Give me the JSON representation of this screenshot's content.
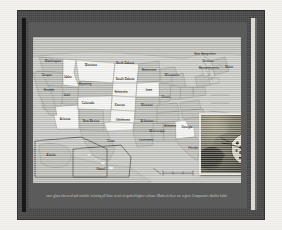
{
  "frame": {
    "outer_mat_color": "#f4f2ee",
    "frame_color": "#4a4a4a",
    "slide_color": "#5b5b5b",
    "left_bar_color": "#181818",
    "right_bar_color": "#dedbd4"
  },
  "map": {
    "title": "",
    "background_color": "#cfcfcb",
    "land_color": "#b9b9b4",
    "highlight_color": "#f4f4f1",
    "border_color": "#8d8d88",
    "water_color": "#c7c7c3",
    "scale_bar_label": "",
    "states": [
      {
        "name": "Washington",
        "x": 20,
        "y": 24,
        "highlight": false,
        "size": "sm"
      },
      {
        "name": "Oregon",
        "x": 14,
        "y": 38,
        "highlight": false,
        "size": "sm"
      },
      {
        "name": "Idaho",
        "x": 35,
        "y": 40,
        "highlight": true,
        "size": "sm"
      },
      {
        "name": "Montana",
        "x": 58,
        "y": 28,
        "highlight": true,
        "size": "sm"
      },
      {
        "name": "North Dakota",
        "x": 92,
        "y": 26,
        "highlight": true,
        "size": "sm"
      },
      {
        "name": "South Dakota",
        "x": 92,
        "y": 42,
        "highlight": true,
        "size": "sm"
      },
      {
        "name": "Minnesota",
        "x": 116,
        "y": 33,
        "highlight": false,
        "size": "sm"
      },
      {
        "name": "Wisconsin",
        "x": 139,
        "y": 38,
        "highlight": false,
        "size": "sm"
      },
      {
        "name": "Wyoming",
        "x": 52,
        "y": 47,
        "highlight": false,
        "size": "sm"
      },
      {
        "name": "Nevada",
        "x": 16,
        "y": 53,
        "highlight": false,
        "size": "sm"
      },
      {
        "name": "Utah",
        "x": 34,
        "y": 58,
        "highlight": false,
        "size": "sm"
      },
      {
        "name": "Nebraska",
        "x": 88,
        "y": 55,
        "highlight": true,
        "size": "sm"
      },
      {
        "name": "Iowa",
        "x": 116,
        "y": 53,
        "highlight": true,
        "size": "sm"
      },
      {
        "name": "Colorado",
        "x": 55,
        "y": 66,
        "highlight": true,
        "size": "sm"
      },
      {
        "name": "Kansas",
        "x": 87,
        "y": 68,
        "highlight": true,
        "size": "sm"
      },
      {
        "name": "Missouri",
        "x": 114,
        "y": 68,
        "highlight": false,
        "size": "sm"
      },
      {
        "name": "Illinois",
        "x": 133,
        "y": 60,
        "highlight": false,
        "size": "sm"
      },
      {
        "name": "Arizona",
        "x": 32,
        "y": 82,
        "highlight": true,
        "size": "sm"
      },
      {
        "name": "New Mexico",
        "x": 58,
        "y": 84,
        "highlight": false,
        "size": "sm"
      },
      {
        "name": "Oklahoma",
        "x": 90,
        "y": 83,
        "highlight": true,
        "size": "sm"
      },
      {
        "name": "Arkansas",
        "x": 114,
        "y": 84,
        "highlight": false,
        "size": "sm"
      },
      {
        "name": "Texas",
        "x": 78,
        "y": 104,
        "highlight": false,
        "size": "sm"
      },
      {
        "name": "Louisiana",
        "x": 113,
        "y": 103,
        "highlight": false,
        "size": "sm"
      },
      {
        "name": "Mississippi",
        "x": 124,
        "y": 94,
        "highlight": false,
        "size": "sm"
      },
      {
        "name": "Alabama",
        "x": 137,
        "y": 89,
        "highlight": false,
        "size": "sm"
      },
      {
        "name": "Georgia",
        "x": 154,
        "y": 90,
        "highlight": true,
        "size": "sm"
      },
      {
        "name": "Florida",
        "x": 160,
        "y": 111,
        "highlight": false,
        "size": "sm"
      },
      {
        "name": "New Hampshire",
        "x": 172,
        "y": 17,
        "highlight": false,
        "size": "sm"
      },
      {
        "name": "Vermont",
        "x": 175,
        "y": 24,
        "highlight": false,
        "size": "sm"
      },
      {
        "name": "Massachusetts",
        "x": 176,
        "y": 31,
        "highlight": false,
        "size": "sm"
      },
      {
        "name": "Maine",
        "x": 196,
        "y": 30,
        "highlight": false,
        "size": "sm"
      },
      {
        "name": "Alaska",
        "x": 18,
        "y": 118,
        "highlight": false,
        "size": "sm"
      },
      {
        "name": "Hawaii",
        "x": 68,
        "y": 132,
        "highlight": false,
        "size": "sm"
      }
    ]
  },
  "photo_inset": {
    "name": "butterfly-photograph",
    "border_color": "#e8e6df",
    "alt": "close-up photograph of a spotted butterfly on foliage"
  },
  "caption": {
    "text": "ance glass observed and variable coloring all State views of spotted lighter colours. Marks in these are region. Comparative datifier habit."
  }
}
